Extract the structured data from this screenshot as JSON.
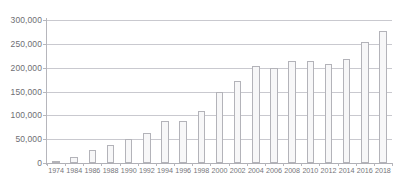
{
  "chart_data": {
    "type": "bar",
    "title": "",
    "xlabel": "",
    "ylabel": "",
    "ylim": [
      0,
      300000
    ],
    "grid": true,
    "legend": "none",
    "ytick_labels": [
      "300,000",
      "250,000",
      "200,000",
      "150,000",
      "100,000",
      "50,000",
      "0"
    ],
    "ytick_values": [
      300000,
      250000,
      200000,
      150000,
      100000,
      50000,
      0
    ],
    "categories": [
      "1974",
      "1984",
      "1986",
      "1988",
      "1990",
      "1992",
      "1994",
      "1996",
      "1998",
      "2000",
      "2002",
      "2004",
      "2006",
      "2008",
      "2010",
      "2012",
      "2014",
      "2016",
      "2018"
    ],
    "values": [
      3000,
      13000,
      27000,
      38000,
      51000,
      64000,
      88000,
      88000,
      110000,
      148000,
      172000,
      203000,
      200000,
      215000,
      215000,
      208000,
      219000,
      253000,
      277000
    ],
    "series": [
      {
        "name": "",
        "values": [
          3000,
          13000,
          27000,
          38000,
          51000,
          64000,
          88000,
          88000,
          110000,
          148000,
          172000,
          203000,
          200000,
          215000,
          215000,
          208000,
          219000,
          253000,
          277000
        ]
      }
    ]
  },
  "colors": {
    "bar_fill": "#f7f7f8",
    "bar_stroke": "#b3b3b9",
    "gridline": "#c9c9cf",
    "axis": "#b0b0b6",
    "tick_text": "#6e6e73"
  }
}
